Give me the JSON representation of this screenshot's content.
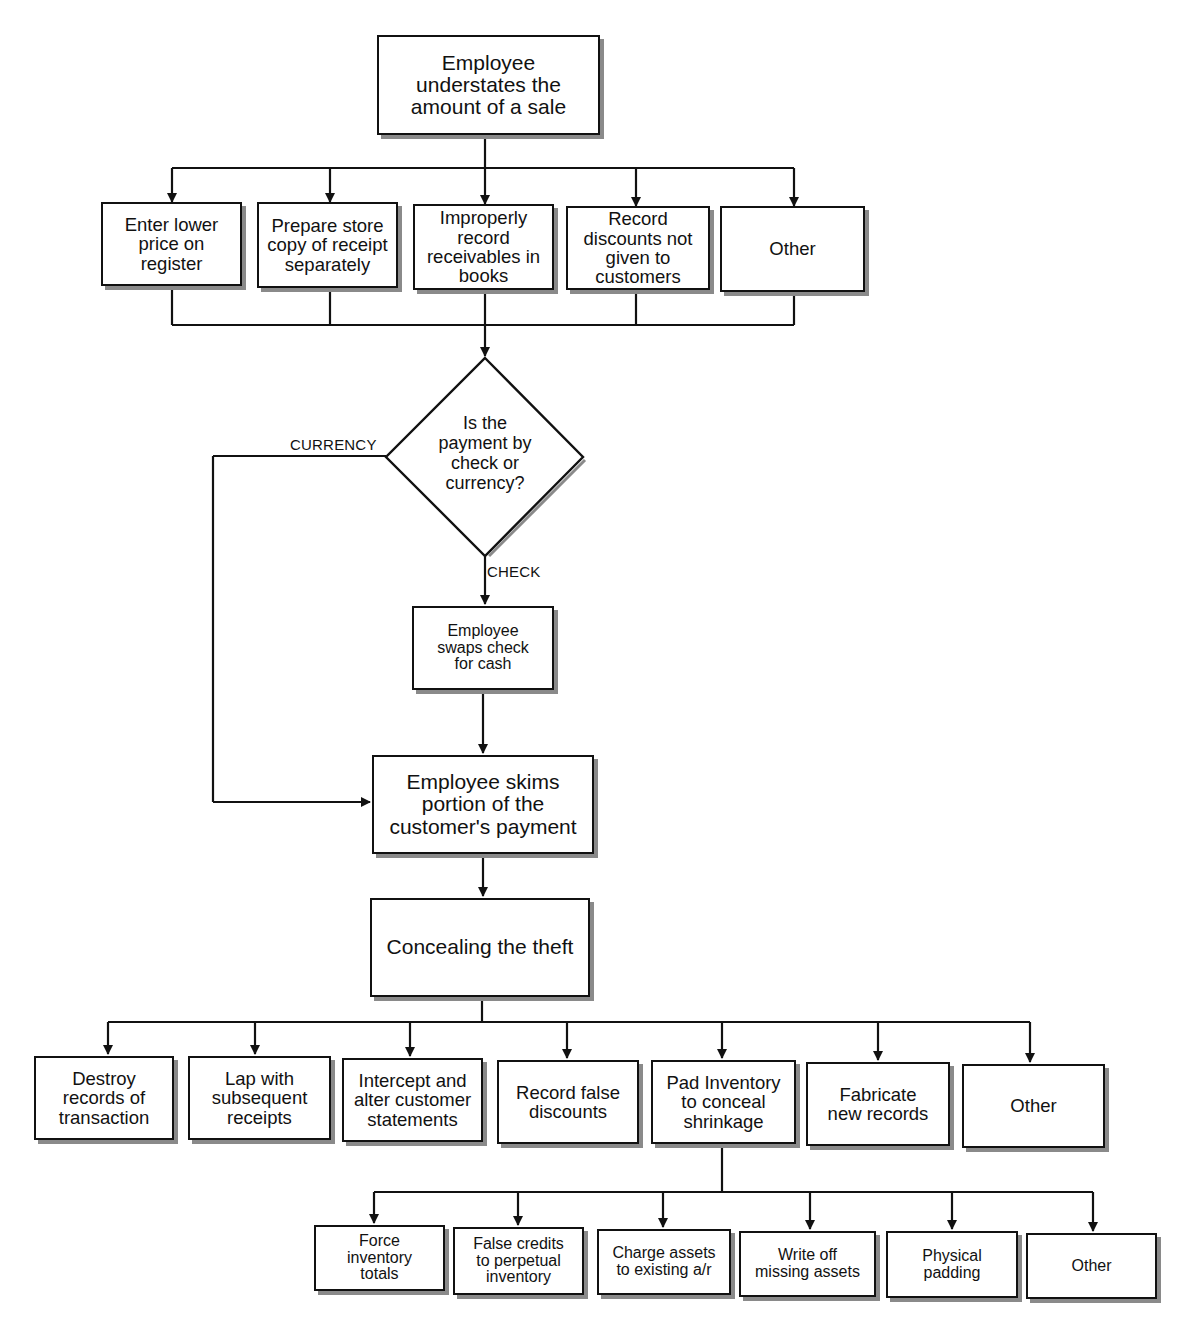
{
  "diagram": {
    "type": "flowchart",
    "start": {
      "label": "Employee\nunderstates the\namount of a sale"
    },
    "methods": [
      {
        "label": "Enter lower\nprice on\nregister"
      },
      {
        "label": "Prepare store\ncopy of receipt\nseparately"
      },
      {
        "label": "Improperly\nrecord\nreceivables in\nbooks"
      },
      {
        "label": "Record\ndiscounts not\ngiven to\ncustomers"
      },
      {
        "label": "Other"
      }
    ],
    "decision": {
      "label": "Is the\npayment by\ncheck or\ncurrency?",
      "branch_left": "CURRENCY",
      "branch_down": "CHECK"
    },
    "swap": {
      "label": "Employee\nswaps check\nfor cash"
    },
    "skim": {
      "label": "Employee skims\nportion of the\ncustomer's payment"
    },
    "conceal": {
      "label": "Concealing the theft"
    },
    "concealment_methods": [
      {
        "label": "Destroy\nrecords of\ntransaction"
      },
      {
        "label": "Lap with\nsubsequent\nreceipts"
      },
      {
        "label": "Intercept and\nalter customer\nstatements"
      },
      {
        "label": "Record false\ndiscounts"
      },
      {
        "label": "Pad Inventory\nto conceal\nshrinkage"
      },
      {
        "label": "Fabricate\nnew records"
      },
      {
        "label": "Other"
      }
    ],
    "inventory_padding_methods": [
      {
        "label": "Force\ninventory\ntotals"
      },
      {
        "label": "False credits\nto perpetual\ninventory"
      },
      {
        "label": "Charge assets\nto existing a/r"
      },
      {
        "label": "Write off\nmissing assets"
      },
      {
        "label": "Physical\npadding"
      },
      {
        "label": "Other"
      }
    ]
  },
  "colors": {
    "line": "#111111",
    "shadow": "#8a8a8a",
    "background": "#ffffff"
  }
}
